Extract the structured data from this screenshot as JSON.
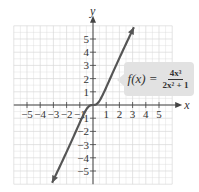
{
  "chart_data": {
    "type": "line",
    "title": "",
    "function_label": "f(x) = 4x^3 / (2x^2 + 1)",
    "xlabel": "x",
    "ylabel": "y",
    "xlim": [
      -6,
      6
    ],
    "ylim": [
      -6,
      6
    ],
    "grid": true,
    "x_ticks": [
      -5,
      -4,
      -3,
      -2,
      -1,
      1,
      2,
      3,
      4,
      5
    ],
    "y_ticks": [
      -5,
      -4,
      -3,
      -2,
      -1,
      1,
      2,
      3,
      4,
      5
    ],
    "x_tick_labels": [
      "−5",
      "−4",
      "−3",
      "−2",
      "−1",
      "1",
      "2",
      "3",
      "4",
      "5"
    ],
    "y_tick_labels": [
      "−5",
      "−4",
      "−3",
      "−2",
      "−1",
      "1",
      "2",
      "3",
      "4",
      "5"
    ],
    "series": [
      {
        "name": "f(x) = 4x^3/(2x^2+1)",
        "x": [
          -3.1,
          -2.5,
          -2,
          -1.5,
          -1,
          -0.75,
          -0.5,
          -0.25,
          0,
          0.25,
          0.5,
          0.75,
          1,
          1.5,
          2,
          2.5,
          3.1
        ],
        "y": [
          -5.9,
          -4.76,
          -3.56,
          -2.45,
          -1.33,
          -0.81,
          -0.33,
          -0.06,
          0,
          0.06,
          0.33,
          0.81,
          1.33,
          2.45,
          3.56,
          4.76,
          5.9
        ]
      }
    ],
    "arrows": "both ends"
  },
  "formula": {
    "lhs": "f(x) =",
    "numerator": "4x³",
    "denominator": "2x² + 1"
  },
  "colors": {
    "curve": "#555555",
    "grid": "#d8d8d8",
    "axis": "#444444",
    "label_box": "#e2e2e2"
  }
}
